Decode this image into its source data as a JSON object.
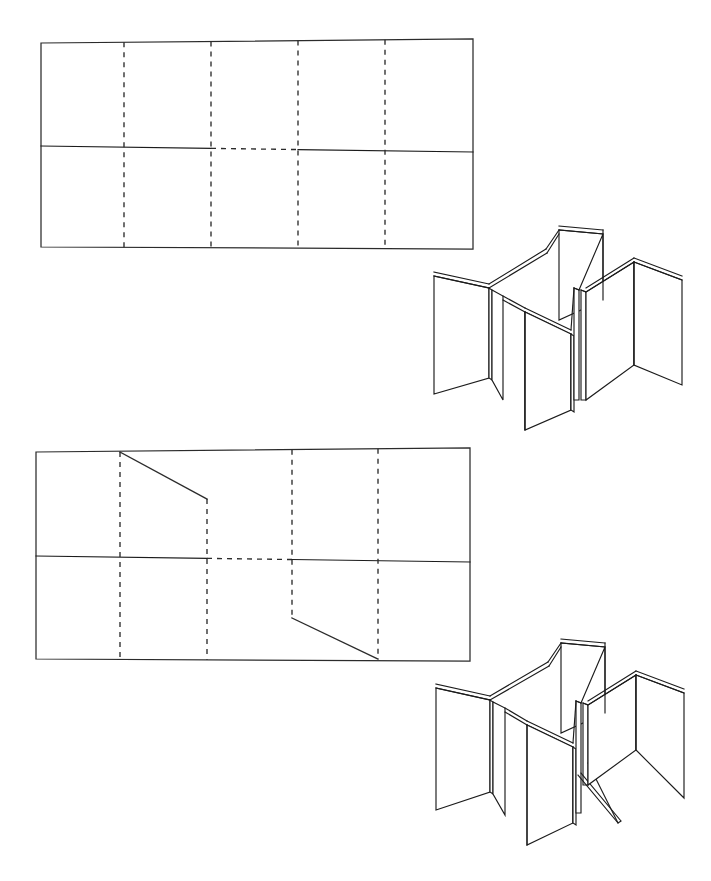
{
  "page": {
    "caption_top": "",
    "background_color": "#ffffff",
    "ink_color": "#2b2b2b",
    "width": 711,
    "height": 881
  },
  "figures": [
    {
      "id": "figure-1",
      "net": {
        "name": "net-plain",
        "label": "",
        "outline": {
          "top_left": [
            41,
            43
          ],
          "top_right": [
            473,
            39
          ],
          "bottom_right": [
            473,
            249
          ],
          "bottom_left": [
            41,
            247
          ]
        },
        "rows": 2,
        "columns": 5,
        "fold_lines_vertical_x": [
          124,
          211,
          298,
          385
        ],
        "midline_y_left": 146,
        "midline_y_right": 152,
        "midline_dashed_span_x": [
          211,
          298
        ],
        "cut_lines": []
      },
      "solid": {
        "name": "folded-solid-plain",
        "label": "",
        "bounds": [
          428,
          228,
          262,
          185
        ],
        "panel_count": 10,
        "has_diagonal_cut": false
      }
    },
    {
      "id": "figure-2",
      "net": {
        "name": "net-with-cuts",
        "label": "",
        "outline": {
          "top_left": [
            36,
            452
          ],
          "top_right": [
            470,
            448
          ],
          "bottom_right": [
            470,
            661
          ],
          "bottom_left": [
            36,
            659
          ]
        },
        "rows": 2,
        "columns": 5,
        "fold_lines_vertical_x": [
          120,
          207,
          292,
          378
        ],
        "midline_y_left": 556,
        "midline_y_right": 562,
        "midline_dashed_span_x": [
          207,
          292
        ],
        "cut_lines": [
          {
            "from": [
              120,
              452
            ],
            "to": [
              207,
              499
            ],
            "row": "top"
          },
          {
            "from": [
              292,
              618
            ],
            "to": [
              378,
              659
            ],
            "row": "bottom"
          }
        ]
      },
      "solid": {
        "name": "folded-solid-with-cuts",
        "label": "",
        "bounds": [
          430,
          658,
          262,
          190
        ],
        "panel_count": 10,
        "has_diagonal_cut": true
      }
    }
  ],
  "legend": {
    "solid_line_meaning": "cut / outer edge",
    "dashed_line_meaning": "fold line"
  }
}
